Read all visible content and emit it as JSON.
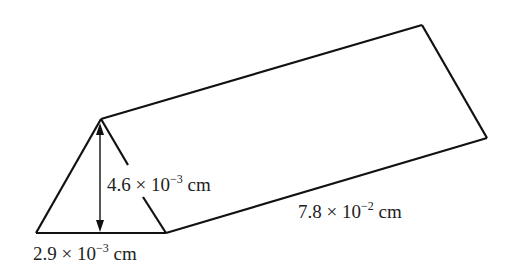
{
  "diagram": {
    "type": "triangular prism",
    "labels": {
      "height": {
        "mantissa": "4.6",
        "times": "×",
        "base": "10",
        "exponent": "−3",
        "unit": "cm"
      },
      "base": {
        "mantissa": "2.9",
        "times": "×",
        "base": "10",
        "exponent": "−3",
        "unit": "cm"
      },
      "length": {
        "mantissa": "7.8",
        "times": "×",
        "base": "10",
        "exponent": "−2",
        "unit": "cm"
      }
    },
    "stroke_color": "#111111"
  }
}
